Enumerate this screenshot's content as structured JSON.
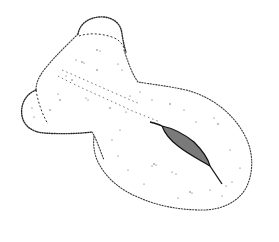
{
  "illustration": {
    "subject": "stippled scientific drawing of a lobed specimen with a dark elongated central body",
    "style": "pen-and-ink stipple on white",
    "colors": {
      "background": "#ffffff",
      "ink": "#2a2a2a",
      "organ_fill": "#7a7a7a"
    },
    "parts": [
      {
        "name": "upper-small-lobe"
      },
      {
        "name": "left-lobe"
      },
      {
        "name": "main-body"
      },
      {
        "name": "lower-large-lobe"
      },
      {
        "name": "central-dark-organ"
      }
    ]
  }
}
